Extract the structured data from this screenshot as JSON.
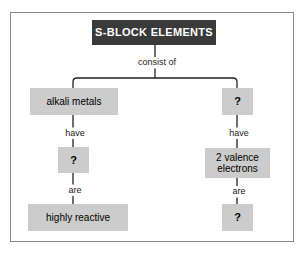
{
  "diagram": {
    "type": "concept-map",
    "title_node": {
      "label": "S-BLOCK ELEMENTS",
      "fill": "#3a3a3a",
      "text_color": "#ffffff"
    },
    "box_fill": "#cccccc",
    "frame_color": "#8a8a8a",
    "background": "#ffffff",
    "link_labels": {
      "consist_of": "consist of",
      "have_left": "have",
      "have_right": "have",
      "are_left": "are",
      "are_right": "are"
    },
    "branches": {
      "left": {
        "node_1": "alkali metals",
        "node_2": "?",
        "node_3": "highly reactive"
      },
      "right": {
        "node_1": "?",
        "node_2": "2 valence\nelectrons",
        "node_2_line_1": "2 valence",
        "node_2_line_2": "electrons",
        "node_3": "?"
      }
    }
  }
}
